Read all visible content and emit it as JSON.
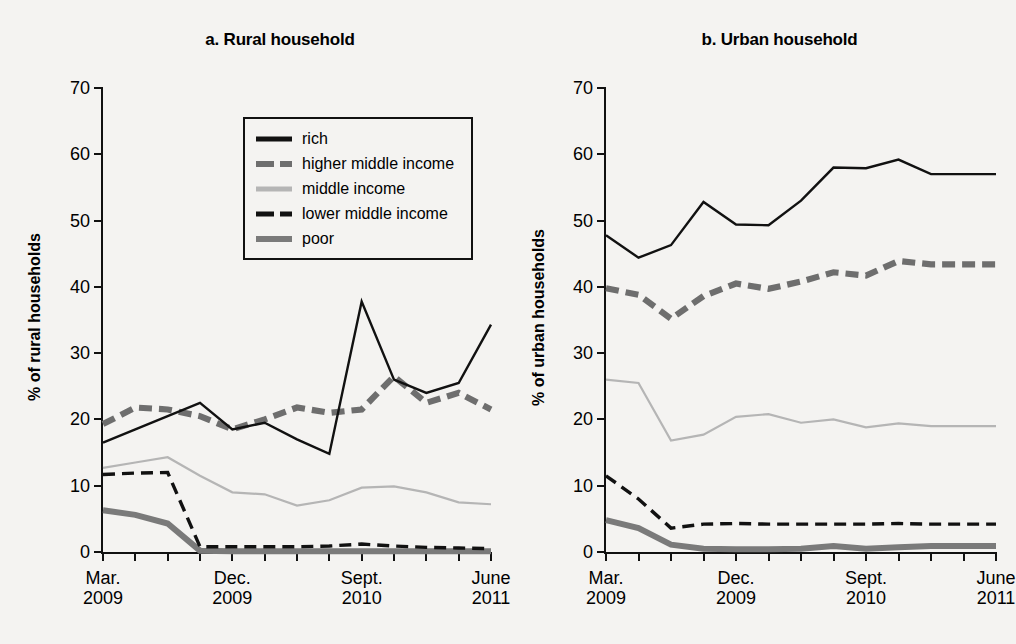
{
  "figure": {
    "legend": {
      "items": [
        {
          "label": "rich",
          "key": "line-solid-black",
          "color": "#111111"
        },
        {
          "label": "higher middle income",
          "key": "line-dashed-gray",
          "color": "#6e6e6e"
        },
        {
          "label": "middle income",
          "key": "line-solid-lightgray",
          "color": "#b5b5b5"
        },
        {
          "label": "lower middle income",
          "key": "line-dashed-black",
          "color": "#111111"
        },
        {
          "label": "poor",
          "key": "line-solid-gray",
          "color": "#7a7a7a"
        }
      ]
    }
  },
  "chart_data": [
    {
      "type": "line",
      "title": "a. Rural household",
      "xlabel": "",
      "ylabel": "% of rural households",
      "ylim": [
        0,
        70
      ],
      "yticks": [
        0,
        10,
        20,
        30,
        40,
        50,
        60,
        70
      ],
      "grid": false,
      "legend_position": "inside-upper-center",
      "x": [
        0,
        1,
        2,
        3,
        4,
        5,
        6,
        7,
        8,
        9,
        10,
        11,
        12
      ],
      "tick_labels": [
        {
          "index": 0,
          "line1": "Mar.",
          "line2": "2009"
        },
        {
          "index": 4,
          "line1": "Dec.",
          "line2": "2009"
        },
        {
          "index": 8,
          "line1": "Sept.",
          "line2": "2010"
        },
        {
          "index": 12,
          "line1": "June",
          "line2": "2011"
        }
      ],
      "series": [
        {
          "name": "rich",
          "values": [
            16.5,
            18.5,
            20.5,
            22.5,
            18.5,
            19.5,
            17.0,
            14.8,
            37.8,
            26.0,
            24.0,
            25.5,
            34.3
          ]
        },
        {
          "name": "higher middle income",
          "values": [
            19.3,
            21.8,
            21.5,
            20.5,
            18.5,
            20.0,
            21.8,
            21.0,
            21.5,
            26.5,
            22.5,
            24.0,
            21.5
          ]
        },
        {
          "name": "middle income",
          "values": [
            12.7,
            13.5,
            14.3,
            11.5,
            9.0,
            8.7,
            7.0,
            7.8,
            9.7,
            9.9,
            9.0,
            7.5,
            7.2
          ]
        },
        {
          "name": "lower middle income",
          "values": [
            11.7,
            11.9,
            12.0,
            0.8,
            0.8,
            0.8,
            0.8,
            0.9,
            1.2,
            0.9,
            0.7,
            0.6,
            0.5
          ]
        },
        {
          "name": "poor",
          "values": [
            6.3,
            5.6,
            4.3,
            0.2,
            0.1,
            0.1,
            0.1,
            0.1,
            0.1,
            0.1,
            0.1,
            0.1,
            0.1
          ]
        }
      ],
      "notes": "rich series continues past tick 12 to a final rise"
    },
    {
      "type": "line",
      "title": "b. Urban household",
      "xlabel": "",
      "ylabel": "% of urban households",
      "ylim": [
        0,
        70
      ],
      "yticks": [
        0,
        10,
        20,
        30,
        40,
        50,
        60,
        70
      ],
      "grid": false,
      "legend_position": "none",
      "x": [
        0,
        1,
        2,
        3,
        4,
        5,
        6,
        7,
        8,
        9,
        10,
        11,
        12
      ],
      "tick_labels": [
        {
          "index": 0,
          "line1": "Mar.",
          "line2": "2009"
        },
        {
          "index": 4,
          "line1": "Dec.",
          "line2": "2009"
        },
        {
          "index": 8,
          "line1": "Sept.",
          "line2": "2010"
        },
        {
          "index": 12,
          "line1": "June",
          "line2": "2011"
        }
      ],
      "series": [
        {
          "name": "rich",
          "values": [
            47.8,
            44.4,
            46.3,
            52.8,
            49.4,
            49.3,
            53.0,
            58.0,
            57.9,
            59.2,
            57.0,
            57.0,
            57.0
          ]
        },
        {
          "name": "higher middle income",
          "values": [
            39.8,
            38.8,
            35.2,
            38.6,
            40.5,
            39.7,
            40.8,
            42.2,
            41.7,
            43.9,
            43.4,
            43.4,
            43.4
          ]
        },
        {
          "name": "middle income",
          "values": [
            26.0,
            25.5,
            16.8,
            17.7,
            20.4,
            20.8,
            19.5,
            20.0,
            18.8,
            19.4,
            19.0,
            19.0,
            19.0
          ]
        },
        {
          "name": "lower middle income",
          "values": [
            11.5,
            8.0,
            3.6,
            4.2,
            4.3,
            4.2,
            4.2,
            4.2,
            4.2,
            4.3,
            4.2,
            4.2,
            4.2
          ]
        },
        {
          "name": "poor",
          "values": [
            4.8,
            3.6,
            1.1,
            0.5,
            0.4,
            0.4,
            0.5,
            0.9,
            0.5,
            0.7,
            0.9,
            0.9,
            0.9
          ]
        }
      ],
      "notes": "urban series are flatter after Dec 2009"
    }
  ]
}
